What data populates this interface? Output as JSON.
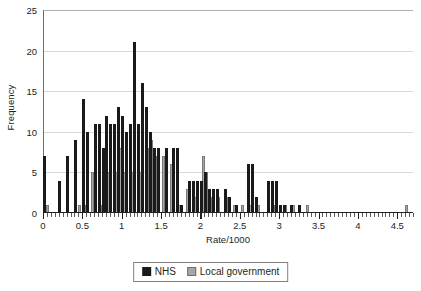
{
  "chart_data": {
    "type": "bar",
    "title": "",
    "subtitle": "",
    "xlabel": "Rate/1000",
    "ylabel": "Frequency",
    "grid": true,
    "legend_position": "bottom-center",
    "xlim": [
      0,
      4.7
    ],
    "ylim": [
      0,
      25
    ],
    "ytick_labels": [
      "0",
      "5",
      "10",
      "15",
      "20",
      "25"
    ],
    "ytick_values": [
      0,
      5,
      10,
      15,
      20,
      25
    ],
    "xtick_labels": [
      "0",
      "0.5",
      "1",
      "1.5",
      "2",
      "2.5",
      "3",
      "3.5",
      "4",
      "4.5"
    ],
    "xtick_values": [
      0,
      0.5,
      1,
      1.5,
      2,
      2.5,
      3,
      3.5,
      4,
      4.5
    ],
    "xtick_minor_step": 0.05,
    "colors": {
      "nhs": "#1a1a1a",
      "local_government": "#a6a6a6",
      "grid": "#d9d9d9",
      "axis": "#231f20"
    },
    "series": [
      {
        "name": "NHS",
        "color": "#1a1a1a",
        "x": [
          0.0,
          0.2,
          0.3,
          0.4,
          0.5,
          0.55,
          0.65,
          0.7,
          0.75,
          0.8,
          0.85,
          0.9,
          0.95,
          1.0,
          1.05,
          1.1,
          1.15,
          1.2,
          1.25,
          1.3,
          1.35,
          1.4,
          1.45,
          1.55,
          1.65,
          1.7,
          1.75,
          1.85,
          1.9,
          1.95,
          2.0,
          2.05,
          2.1,
          2.15,
          2.2,
          2.3,
          2.35,
          2.45,
          2.6,
          2.65,
          2.7,
          2.85,
          2.9,
          2.95,
          3.0,
          3.05,
          3.15,
          3.25
        ],
        "values": [
          7,
          4,
          7,
          9,
          14,
          10,
          11,
          11,
          8,
          12,
          11,
          11,
          13,
          12,
          10,
          11,
          21,
          11,
          16,
          13,
          10,
          8,
          8,
          8,
          8,
          8,
          1,
          4,
          4,
          4,
          4,
          5,
          3,
          3,
          3,
          3,
          2,
          1,
          6,
          6,
          2,
          4,
          4,
          4,
          1,
          1,
          1,
          1
        ]
      },
      {
        "name": "Local government",
        "color": "#a6a6a6",
        "x": [
          0.05,
          0.45,
          0.52,
          0.62,
          0.72,
          0.82,
          0.92,
          0.97,
          1.02,
          1.12,
          1.22,
          1.32,
          1.37,
          1.42,
          1.52,
          1.62,
          1.72,
          1.82,
          1.92,
          2.02,
          2.07,
          2.12,
          2.22,
          2.32,
          2.42,
          2.52,
          2.62,
          2.72,
          2.92,
          3.07,
          3.17,
          3.35,
          4.6
        ],
        "values": [
          1,
          1,
          1,
          5,
          1,
          5,
          5,
          8,
          5,
          5,
          5,
          8,
          9,
          7,
          7,
          6,
          1,
          3,
          2,
          7,
          5,
          2,
          2,
          2,
          1,
          1,
          1,
          1,
          1,
          1,
          1,
          1,
          1
        ]
      }
    ]
  },
  "legend": {
    "entries": [
      {
        "label": "NHS",
        "swatch": "legend-swatch-nhs"
      },
      {
        "label": "Local government",
        "swatch": "legend-swatch-local-government"
      }
    ]
  }
}
